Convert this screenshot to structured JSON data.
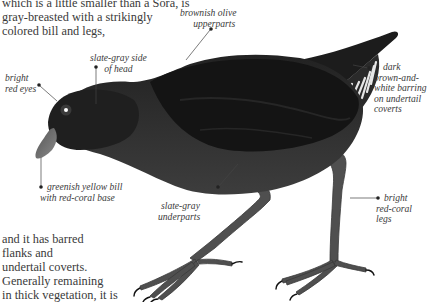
{
  "text": {
    "intro_lines": [
      "which is a little smaller than a Sora, is",
      "gray-breasted with a strikingly",
      "colored bill and legs,"
    ],
    "outro_lines": [
      "and it has barred",
      "flanks and",
      "undertail coverts.",
      "Generally remaining",
      "in thick vegetation, it is"
    ]
  },
  "labels": {
    "upperparts": [
      "brownish olive",
      "upperparts"
    ],
    "side_of_head": [
      "slate-gray side",
      "of head"
    ],
    "eyes": [
      "bright",
      "red eyes"
    ],
    "undertail": [
      "dark",
      "brown-and-",
      "white barring",
      "on undertail",
      "coverts"
    ],
    "bill": [
      "greenish yellow bill",
      "with red-coral base"
    ],
    "underparts": [
      "slate-gray",
      "underparts"
    ],
    "legs": [
      "bright",
      "red-coral",
      "legs"
    ]
  },
  "colors": {
    "body": "#2b2b2b",
    "upperparts": "#1a1a1a",
    "underparts": "#3a3a3a",
    "legs": "#4d4d4d",
    "bill": "#6e6e6e",
    "text": "#3a3a3a"
  }
}
